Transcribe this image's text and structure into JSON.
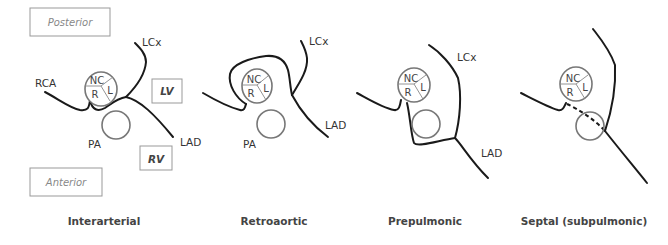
{
  "orientation": {
    "posterior": "Posterior",
    "anterior": "Anterior"
  },
  "chambers": {
    "lv": "LV",
    "rv": "RV"
  },
  "cusps": {
    "nc": "NC",
    "r": "R",
    "l": "L"
  },
  "vessels": {
    "rca": "RCA",
    "lcx": "LCx",
    "lad": "LAD",
    "pa": "PA"
  },
  "panels": [
    {
      "caption": "Interarterial"
    },
    {
      "caption": "Retroaortic"
    },
    {
      "caption": "Prepulmonic"
    },
    {
      "caption": "Septal (subpulmonic)"
    }
  ]
}
